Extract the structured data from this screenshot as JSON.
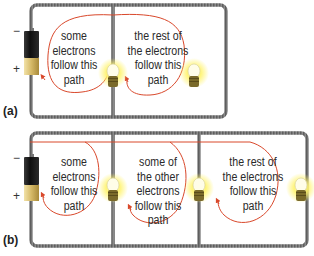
{
  "diagram": {
    "panel_a": {
      "label": "(a)",
      "battery": {
        "minus": "−",
        "plus": "+"
      },
      "paths": [
        {
          "text_lines": [
            "some",
            "electrons",
            "follow this",
            "path"
          ]
        },
        {
          "text_lines": [
            "the rest of",
            "the electrons",
            "follow this",
            "path"
          ]
        }
      ],
      "bulbs": 2
    },
    "panel_b": {
      "label": "(b)",
      "battery": {
        "minus": "−",
        "plus": "+"
      },
      "paths": [
        {
          "text_lines": [
            "some",
            "electrons",
            "follow this",
            "path"
          ]
        },
        {
          "text_lines": [
            "some of",
            "the other",
            "electrons",
            "follow this",
            "path"
          ]
        },
        {
          "text_lines": [
            "the rest of",
            "the electrons",
            "follow this",
            "path"
          ]
        }
      ],
      "bulbs": 3
    },
    "colors": {
      "wire": "#7a7a7a",
      "arrow": "#d9482b",
      "battery_body": "#1a1a1a",
      "battery_cap": "#d9c27a",
      "bulb_glow": "#fff27a",
      "bulb_base": "#7a6a2a"
    }
  }
}
